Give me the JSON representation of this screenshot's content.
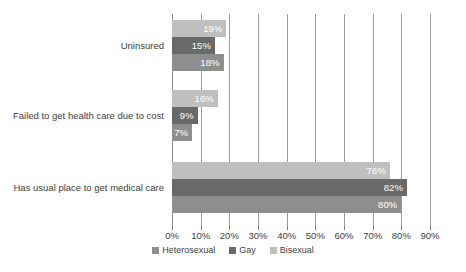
{
  "chart_data": {
    "type": "bar",
    "orientation": "horizontal",
    "title": "",
    "subtitle": "",
    "xlabel": "",
    "ylabel": "",
    "xlim": [
      0,
      90
    ],
    "xtick_step": 10,
    "grid": true,
    "legend_position": "bottom",
    "categories": [
      "Uninsured",
      "Failed to get health care due to cost",
      "Has usual place to get medical care"
    ],
    "tick_labels": [
      "0%",
      "10%",
      "20%",
      "30%",
      "40%",
      "50%",
      "60%",
      "70%",
      "80%",
      "90%"
    ],
    "tick_values": [
      0,
      10,
      20,
      30,
      40,
      50,
      60,
      70,
      80,
      90
    ],
    "series": [
      {
        "name": "Heterosexual",
        "color": "#8e8e8e",
        "values": [
          18,
          7,
          80
        ],
        "value_labels": [
          "18%",
          "7%",
          "80%"
        ]
      },
      {
        "name": "Gay",
        "color": "#696969",
        "values": [
          15,
          9,
          82
        ],
        "value_labels": [
          "15%",
          "9%",
          "82%"
        ]
      },
      {
        "name": "Bisexual",
        "color": "#bfbfbf",
        "values": [
          19,
          16,
          76
        ],
        "value_labels": [
          "19%",
          "16%",
          "76%"
        ]
      }
    ],
    "series_draw_order_top_to_bottom": [
      "Bisexual",
      "Gay",
      "Heterosexual"
    ],
    "colors": {
      "heterosexual": "#8e8e8e",
      "gay": "#696969",
      "bisexual": "#bfbfbf",
      "gridline": "#9a9a9a",
      "text": "#3d3d3d",
      "bar_label_text": "#ffffff",
      "background": "#ffffff"
    }
  },
  "legend": {
    "items": [
      {
        "label": "Heterosexual",
        "color": "#8e8e8e"
      },
      {
        "label": "Gay",
        "color": "#696969"
      },
      {
        "label": "Bisexual",
        "color": "#bfbfbf"
      }
    ]
  }
}
